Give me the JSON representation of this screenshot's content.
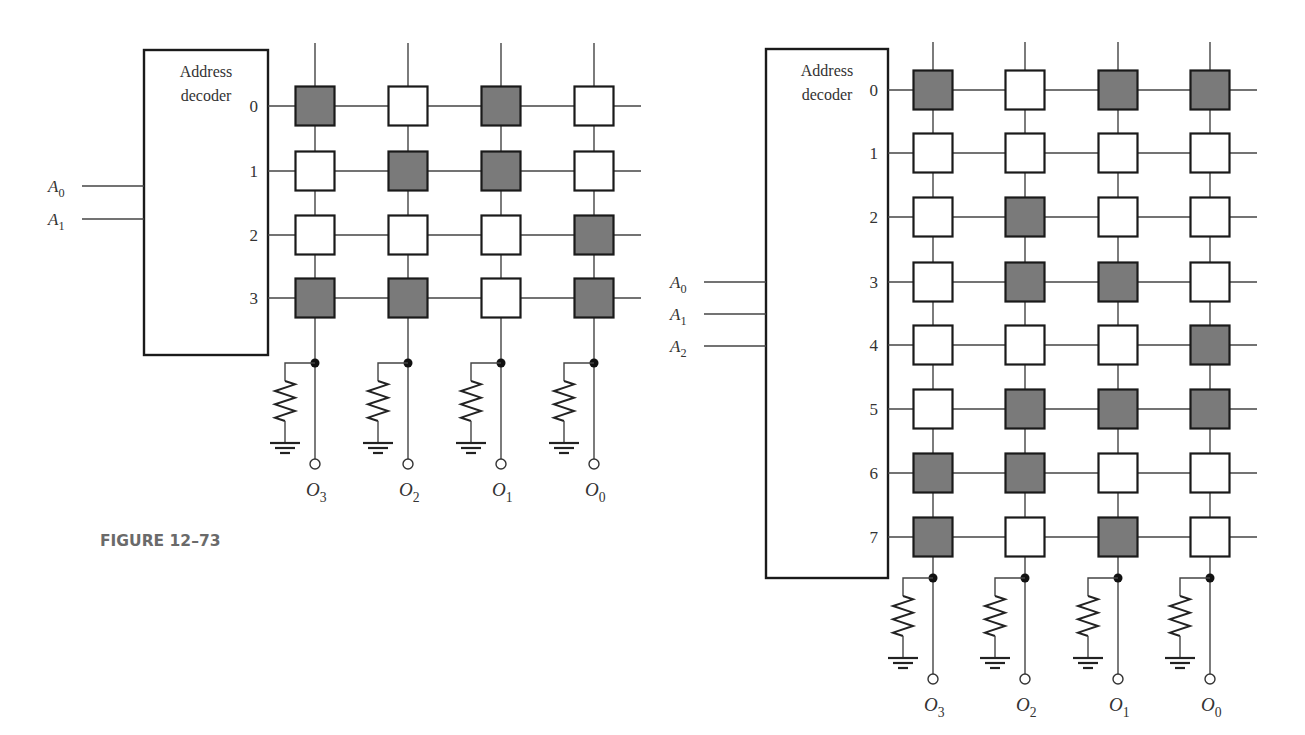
{
  "caption": "FIGURE 12–73",
  "colors": {
    "programmed_cell": "#7a7a7a",
    "unprogrammed_cell": "#ffffff",
    "line": "#444444"
  },
  "rom_left": {
    "decoder_label_line1": "Address",
    "decoder_label_line2": "decoder",
    "address_inputs": [
      {
        "base": "A",
        "sub": "0"
      },
      {
        "base": "A",
        "sub": "1"
      }
    ],
    "row_labels": [
      "0",
      "1",
      "2",
      "3"
    ],
    "outputs": [
      {
        "base": "O",
        "sub": "3"
      },
      {
        "base": "O",
        "sub": "2"
      },
      {
        "base": "O",
        "sub": "1"
      },
      {
        "base": "O",
        "sub": "0"
      }
    ],
    "cells": [
      [
        1,
        0,
        1,
        0
      ],
      [
        0,
        1,
        1,
        0
      ],
      [
        0,
        0,
        0,
        1
      ],
      [
        1,
        1,
        0,
        1
      ]
    ]
  },
  "rom_right": {
    "decoder_label_line1": "Address",
    "decoder_label_line2": "decoder",
    "address_inputs": [
      {
        "base": "A",
        "sub": "0"
      },
      {
        "base": "A",
        "sub": "1"
      },
      {
        "base": "A",
        "sub": "2"
      }
    ],
    "row_labels": [
      "0",
      "1",
      "2",
      "3",
      "4",
      "5",
      "6",
      "7"
    ],
    "outputs": [
      {
        "base": "O",
        "sub": "3"
      },
      {
        "base": "O",
        "sub": "2"
      },
      {
        "base": "O",
        "sub": "1"
      },
      {
        "base": "O",
        "sub": "0"
      }
    ],
    "cells": [
      [
        1,
        0,
        1,
        1
      ],
      [
        0,
        0,
        0,
        0
      ],
      [
        0,
        1,
        0,
        0
      ],
      [
        0,
        1,
        1,
        0
      ],
      [
        0,
        0,
        0,
        1
      ],
      [
        0,
        1,
        1,
        1
      ],
      [
        1,
        1,
        0,
        0
      ],
      [
        1,
        0,
        1,
        0
      ]
    ]
  }
}
